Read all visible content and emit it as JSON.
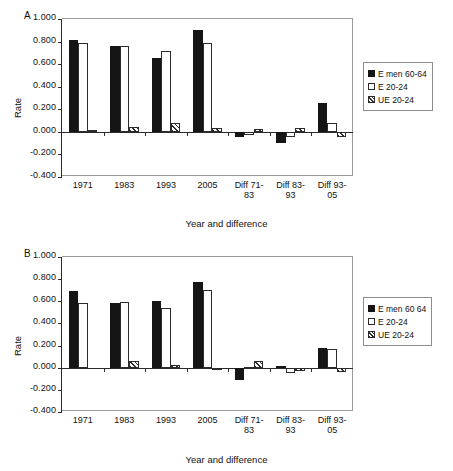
{
  "figure": {
    "panels": [
      {
        "panel_letter": "A",
        "ylabel": "Rate",
        "xlabel": "Year and difference",
        "legend": [
          "E men 60-64",
          "E 20-24",
          "UE 20-24"
        ]
      },
      {
        "panel_letter": "B",
        "ylabel": "Rate",
        "xlabel": "Year and difference",
        "legend": [
          "E men 60 64",
          "E 20-24",
          "UE 20-24"
        ]
      }
    ],
    "ytick_labels": [
      "1.000",
      "0.800",
      "0.600",
      "0.400",
      "0.200",
      "0.000",
      "-0.200",
      "-0.400"
    ],
    "xtick_labels": [
      "1971",
      "1983",
      "1993",
      "2005",
      "Diff 71-\n83",
      "Diff 83-\n93",
      "Diff 93-\n05"
    ]
  },
  "chart_data": [
    {
      "type": "bar",
      "title": "A",
      "xlabel": "Year and difference",
      "ylabel": "Rate",
      "ylim": [
        -0.4,
        1.0
      ],
      "ytick_values": [
        1.0,
        0.8,
        0.6,
        0.4,
        0.2,
        0.0,
        -0.2,
        -0.4
      ],
      "grid": false,
      "legend_position": "right",
      "categories": [
        "1971",
        "1983",
        "1993",
        "2005",
        "Diff 71-83",
        "Diff 83-93",
        "Diff 93-05"
      ],
      "series": [
        {
          "name": "E men 60-64",
          "values": [
            0.81,
            0.76,
            0.655,
            0.905,
            -0.05,
            -0.1,
            0.255
          ]
        },
        {
          "name": "E 20-24",
          "values": [
            0.79,
            0.765,
            0.715,
            0.785,
            -0.03,
            -0.05,
            0.075
          ]
        },
        {
          "name": "UE 20-24",
          "values": [
            0.02,
            0.045,
            0.08,
            0.03,
            0.025,
            0.035,
            -0.05
          ]
        }
      ]
    },
    {
      "type": "bar",
      "title": "B",
      "xlabel": "Year and difference",
      "ylabel": "Rate",
      "ylim": [
        -0.4,
        1.0
      ],
      "ytick_values": [
        1.0,
        0.8,
        0.6,
        0.4,
        0.2,
        0.0,
        -0.2,
        -0.4
      ],
      "grid": false,
      "legend_position": "right",
      "categories": [
        "1971",
        "1983",
        "1993",
        "2005",
        "Diff 71-83",
        "Diff 83-93",
        "Diff 93-05"
      ],
      "series": [
        {
          "name": "E men 60 64",
          "values": [
            0.695,
            0.585,
            0.6,
            0.775,
            -0.11,
            0.02,
            0.175
          ]
        },
        {
          "name": "E 20-24",
          "values": [
            0.585,
            0.59,
            0.54,
            0.7,
            0.01,
            -0.05,
            0.165
          ]
        },
        {
          "name": "UE 20-24",
          "values": [
            0.0,
            0.06,
            0.025,
            -0.015,
            0.06,
            -0.03,
            -0.04
          ]
        }
      ]
    }
  ]
}
